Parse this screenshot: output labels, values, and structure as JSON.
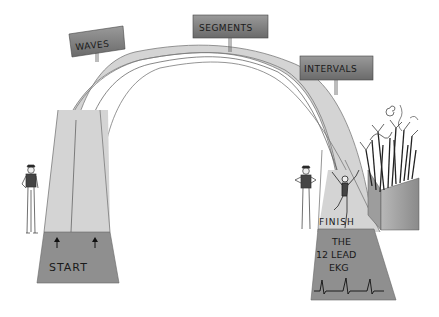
{
  "signs": {
    "waves": "WAVES",
    "segments": "SEGMENTS",
    "intervals": "INTERVALS"
  },
  "start": {
    "label": "START"
  },
  "finish": {
    "banner": "FINISH",
    "line1": "THE",
    "line2": "12 LEAD",
    "line3": "EKG"
  },
  "colors": {
    "track": "#d4d4d4",
    "track_edge": "#7a7a7a",
    "sign_fill": "#7d7d7d",
    "box_fill": "#8f8f8f"
  }
}
